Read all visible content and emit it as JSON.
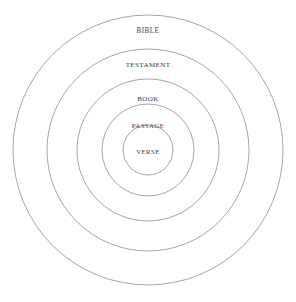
{
  "diagram": {
    "type": "concentric-circles",
    "background_color": "#ffffff",
    "stroke_color": "#8e8e8e",
    "text_color": "#3a3a3a",
    "center": {
      "x": 148,
      "y": 150
    },
    "levels": [
      {
        "label": "BIBLE",
        "depth": 1,
        "radius": 135,
        "label_x": 148,
        "label_y": 31
      },
      {
        "label": "TESTAMENT",
        "depth": 2,
        "radius": 101,
        "label_x": 148,
        "label_y": 65
      },
      {
        "label": "BOOK",
        "depth": 3,
        "radius": 71,
        "label_x": 148,
        "label_y": 99
      },
      {
        "label": "PASSAGE",
        "depth": 4,
        "radius": 46,
        "label_x": 148,
        "label_y": 126
      },
      {
        "label": "VERSE",
        "depth": 5,
        "radius": 25,
        "label_x": 148,
        "label_y": 152
      }
    ]
  }
}
